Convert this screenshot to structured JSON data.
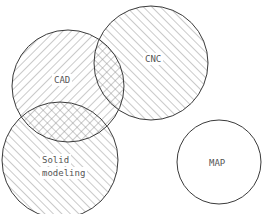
{
  "diagram": {
    "type": "venn",
    "stroke_color": "#3a3a3a",
    "hatch_color": "#8a8a8a",
    "circles": [
      {
        "id": "cad",
        "label": "CAD",
        "cx": 68,
        "cy": 86,
        "r": 56,
        "hatch": "forward"
      },
      {
        "id": "cnc",
        "label": "CNC",
        "cx": 151,
        "cy": 63,
        "r": 57,
        "hatch": "backward"
      },
      {
        "id": "solid",
        "label_line1": "Solid",
        "label_line2": "modeling",
        "cx": 60,
        "cy": 160,
        "r": 58,
        "hatch": "backward"
      },
      {
        "id": "map",
        "label": "MAP",
        "cx": 219,
        "cy": 162,
        "r": 42,
        "hatch": "none"
      }
    ]
  }
}
